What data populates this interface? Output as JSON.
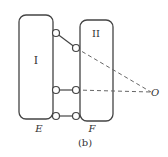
{
  "diagram": {
    "box_left_label": "I",
    "box_right_label": "II",
    "point_left_label": "E",
    "point_right_label": "F",
    "point_o_label": "O",
    "caption": "(b)"
  }
}
